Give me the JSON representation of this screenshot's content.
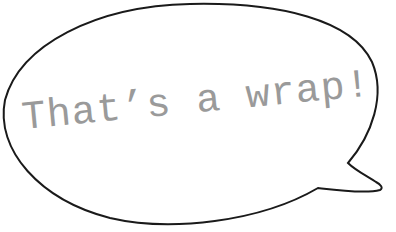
{
  "bubble": {
    "caption": "That’s a wrap!",
    "stroke_color": "#1a1a1a",
    "fill_color": "#ffffff",
    "text_color": "#9a9a9a"
  }
}
